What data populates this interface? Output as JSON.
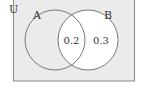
{
  "diagram": {
    "type": "venn",
    "universe_label": "U",
    "sets": [
      {
        "name": "A",
        "label": "A"
      },
      {
        "name": "B",
        "label": "B"
      }
    ],
    "regions": {
      "A_only": "",
      "A_and_B": "0.2",
      "B_only": "0.3"
    },
    "colors": {
      "universe_fill": "#ebebeb",
      "set_b_fill": "#ffffff",
      "outline": "#777777"
    }
  }
}
